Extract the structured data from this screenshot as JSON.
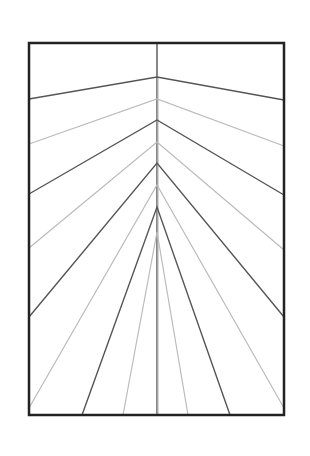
{
  "diagram": {
    "canvas": {
      "width": 310,
      "height": 456,
      "background": "#ffffff"
    },
    "frame": {
      "x": 29,
      "y": 43,
      "width": 255,
      "height": 372,
      "stroke": "#222222",
      "stroke_width": 2.5
    },
    "center_x": 157,
    "colors": {
      "dark": "#555555",
      "light": "#bbbbbb"
    },
    "center_lines": [
      {
        "x1": 157,
        "y1": 43,
        "x2": 157,
        "y2": 415,
        "shade": "dark"
      },
      {
        "x1": 158,
        "y1": 77,
        "x2": 158,
        "y2": 415,
        "shade": "light"
      }
    ],
    "chevrons": [
      {
        "apex_y": 77,
        "left": [
          29,
          99
        ],
        "right": [
          284,
          100
        ],
        "shade": "dark"
      },
      {
        "apex_y": 99,
        "left": [
          29,
          144
        ],
        "right": [
          284,
          146
        ],
        "shade": "light"
      },
      {
        "apex_y": 120,
        "left": [
          29,
          194
        ],
        "right": [
          284,
          195
        ],
        "shade": "dark"
      },
      {
        "apex_y": 142,
        "left": [
          29,
          248
        ],
        "right": [
          284,
          250
        ],
        "shade": "light"
      },
      {
        "apex_y": 163,
        "left": [
          29,
          317
        ],
        "right": [
          284,
          317
        ],
        "shade": "dark"
      },
      {
        "apex_y": 185,
        "left": [
          29,
          408
        ],
        "right": [
          284,
          408
        ],
        "shade": "light"
      },
      {
        "apex_y": 207,
        "left": [
          82,
          415
        ],
        "right": [
          230,
          415
        ],
        "shade": "dark"
      },
      {
        "apex_y": 232,
        "left": [
          123,
          415
        ],
        "right": [
          188,
          415
        ],
        "shade": "light"
      }
    ]
  }
}
